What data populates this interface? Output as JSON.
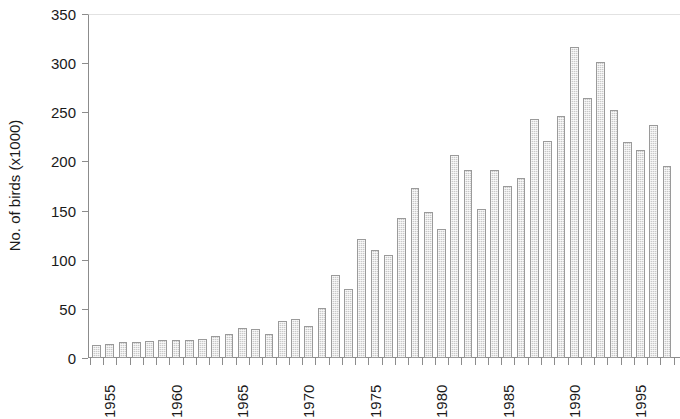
{
  "chart_data": {
    "type": "bar",
    "title": "",
    "subtitle": "",
    "xlabel": "",
    "ylabel": "No. of birds (x1000)",
    "ylim": [
      0,
      350
    ],
    "ytick_labels": [
      "0",
      "50",
      "100",
      "150",
      "200",
      "250",
      "300",
      "350"
    ],
    "yticks": [
      0,
      50,
      100,
      150,
      200,
      250,
      300,
      350
    ],
    "xtick_labels": [
      "1955",
      "1960",
      "1965",
      "1970",
      "1975",
      "1980",
      "1985",
      "1990",
      "1995"
    ],
    "xticks": [
      1955,
      1960,
      1965,
      1970,
      1975,
      1980,
      1985,
      1990,
      1995
    ],
    "grid": false,
    "legend": null,
    "legend_position": "none",
    "bar_fill_color": "#c9c9c9",
    "bar_edge_color": "#9a9a9a",
    "axis_color": "#8c8c8c",
    "text_color": "#1a1a1a",
    "background_color": "#ffffff",
    "categories": [
      "1955",
      "1956",
      "1957",
      "1958",
      "1959",
      "1960",
      "1961",
      "1962",
      "1963",
      "1964",
      "1965",
      "1966",
      "1967",
      "1968",
      "1969",
      "1970",
      "1971",
      "1972",
      "1973",
      "1974",
      "1975",
      "1976",
      "1977",
      "1978",
      "1979",
      "1980",
      "1981",
      "1982",
      "1983",
      "1984",
      "1985",
      "1986",
      "1987",
      "1988",
      "1989",
      "1990",
      "1991",
      "1992",
      "1993",
      "1994",
      "1995",
      "1996",
      "1997",
      "1998"
    ],
    "values": [
      13,
      14,
      16,
      16,
      17,
      18,
      18,
      18,
      19,
      22,
      24,
      31,
      30,
      24,
      38,
      40,
      33,
      51,
      84,
      70,
      121,
      110,
      105,
      142,
      173,
      149,
      131,
      207,
      191,
      152,
      191,
      175,
      183,
      243,
      221,
      246,
      316,
      265,
      301,
      252,
      220,
      212,
      237,
      195
    ]
  }
}
